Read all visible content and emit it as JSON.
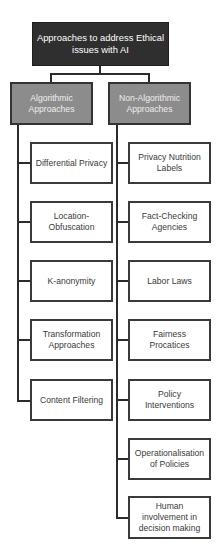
{
  "diagram": {
    "root": {
      "label": "Approaches to address Ethical issues with AI"
    },
    "categories": [
      {
        "label": "Algorithmic Approaches",
        "children": [
          "Differential Privacy",
          "Location-Obfuscation",
          "K-anonymity",
          "Transformation Approaches",
          "Content Filtering"
        ]
      },
      {
        "label": "Non-Algorithmic Approaches",
        "children": [
          "Privacy Nutrition Labels",
          "Fact-Checking Agencies",
          "Labor Laws",
          "Fairness Procatices",
          "Policy Interventions",
          "Operationalisation of Policies",
          "Human involvement in decision making"
        ]
      }
    ]
  },
  "colors": {
    "root_fill": "#2f2f2f",
    "category_fill": "#8c8c8c",
    "leaf_fill": "#ffffff",
    "line": "#2b2b2b"
  }
}
